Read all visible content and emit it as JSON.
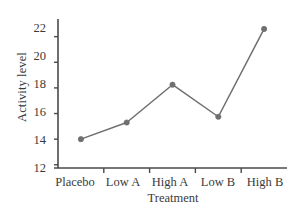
{
  "chart_data": {
    "type": "line",
    "title": "",
    "xlabel": "Treatment",
    "ylabel": "Activity level",
    "categories": [
      "Placebo",
      "Low A",
      "High A",
      "Low B",
      "High B"
    ],
    "values": [
      14.0,
      15.3,
      18.25,
      15.75,
      22.6
    ],
    "series": [
      {
        "name": "Activity level",
        "values": [
          14.0,
          15.3,
          18.25,
          15.75,
          22.6
        ]
      }
    ],
    "yticks": [
      12,
      14,
      16,
      18,
      20,
      22
    ],
    "ytick_labels": [
      "12",
      "14",
      "16",
      "18",
      "20",
      "22"
    ],
    "ylim": [
      11.75,
      23.3
    ],
    "xlim": [
      0,
      5
    ],
    "grid": false,
    "legend": false,
    "legend_position": "none",
    "marker": "circle",
    "line_color": "#6f6f6f",
    "marker_color": "#6f6f6f",
    "axis_color": "#4a4a4a",
    "text_color": "#3a3a3a",
    "background": "#ffffff"
  }
}
